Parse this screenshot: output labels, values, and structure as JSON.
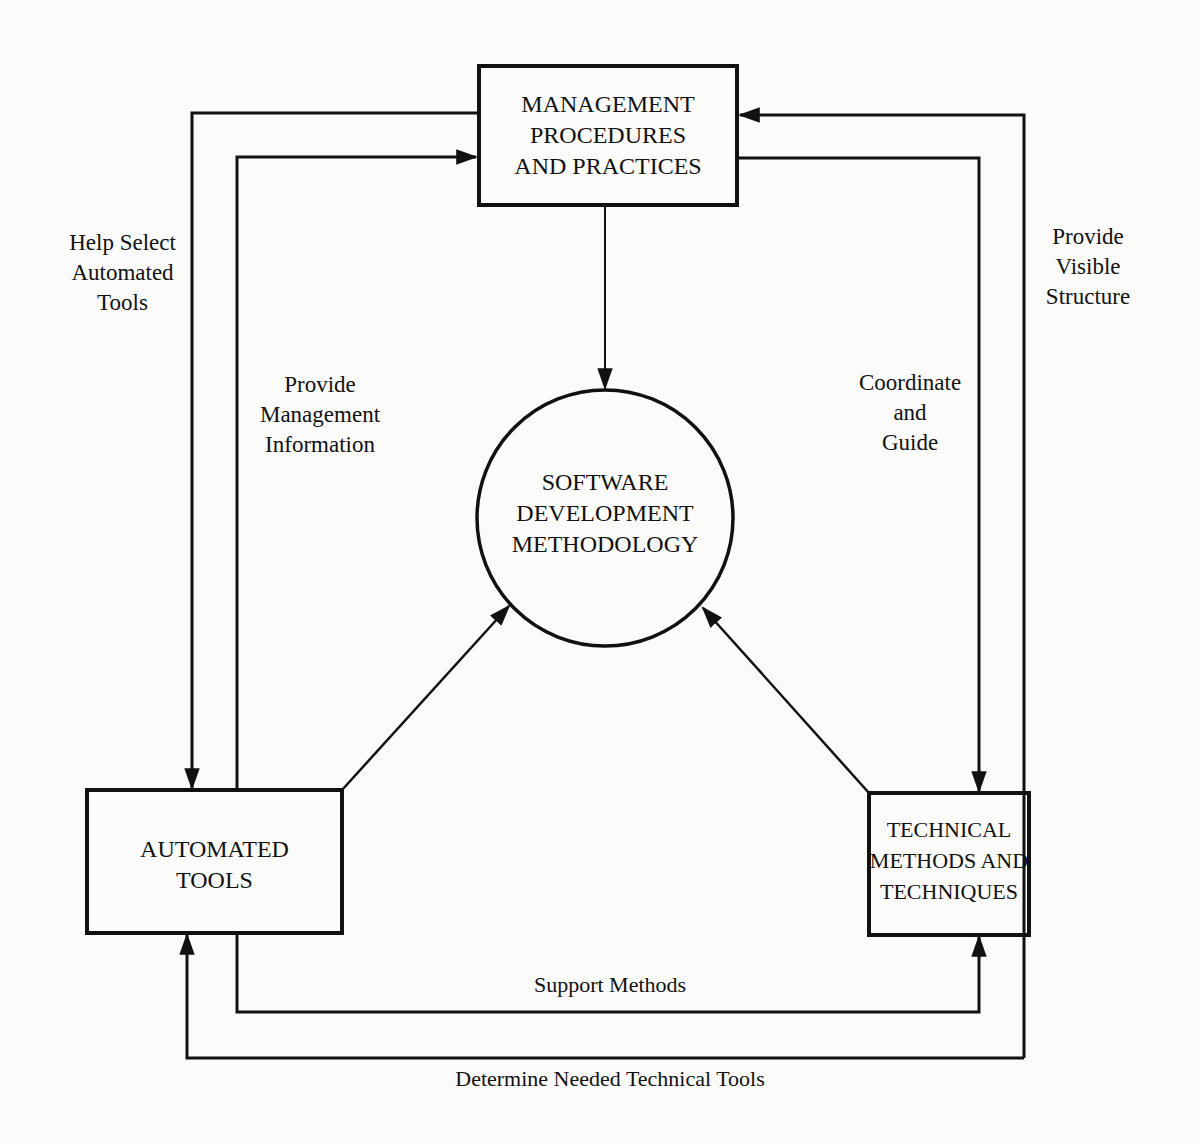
{
  "nodes": {
    "management": {
      "label": "MANAGEMENT\nPROCEDURES\nAND PRACTICES"
    },
    "methodology": {
      "label": "SOFTWARE\nDEVELOPMENT\nMETHODOLOGY"
    },
    "tools": {
      "label": "AUTOMATED\nTOOLS"
    },
    "techniques": {
      "label": "TECHNICAL\nMETHODS AND\nTECHNIQUES"
    }
  },
  "edges": {
    "help_select": {
      "label": "Help Select\nAutomated\nTools",
      "from": "management",
      "to": "tools"
    },
    "provide_mgmt_info": {
      "label": "Provide\nManagement\nInformation",
      "from": "tools",
      "to": "management"
    },
    "provide_visible_structure": {
      "label": "Provide\nVisible\nStructure",
      "from": "techniques",
      "to": "management"
    },
    "coordinate_guide": {
      "label": "Coordinate\nand\nGuide",
      "from": "management",
      "to": "techniques"
    },
    "support_methods": {
      "label": "Support Methods",
      "from": "tools",
      "to": "techniques"
    },
    "determine_tools": {
      "label": "Determine Needed Technical Tools",
      "from": "techniques",
      "to": "tools"
    }
  },
  "colors": {
    "line": "#111111",
    "background": "#fbfbfa"
  }
}
